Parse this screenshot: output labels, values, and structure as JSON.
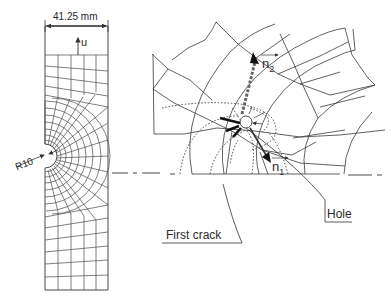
{
  "figure": {
    "left_panel": {
      "dimension_label": "41.25 mm",
      "displacement_label": "u",
      "radius_label": "R10"
    },
    "right_panel": {
      "vector_n1_label": "n",
      "vector_n1_sub": "1",
      "vector_n2_label": "n",
      "vector_n2_sub": "2",
      "hole_label": "Hole",
      "crack_label": "First crack"
    },
    "colors": {
      "line": "#3a3a3a",
      "background": "#ffffff"
    }
  }
}
